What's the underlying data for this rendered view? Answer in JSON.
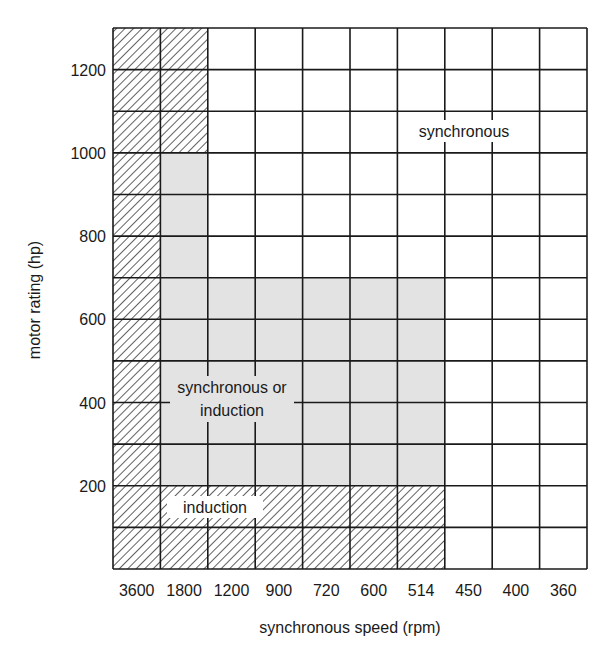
{
  "chart_data": {
    "type": "heatmap",
    "title": "",
    "xlabel": "synchronous speed (rpm)",
    "ylabel": "motor rating (hp)",
    "categories": [
      "3600",
      "1800",
      "1200",
      "900",
      "720",
      "600",
      "514",
      "450",
      "400",
      "360"
    ],
    "y_ticks": [
      200,
      400,
      600,
      800,
      1000,
      1200
    ],
    "ylim": [
      0,
      1300
    ],
    "row_step_hp": 100,
    "grid": true,
    "legend": null,
    "regions": [
      {
        "name": "induction",
        "pattern": "hatched",
        "cells": [
          {
            "cols": [
              "3600"
            ],
            "hp_range": [
              0,
              1300
            ]
          },
          {
            "cols": [
              "1800"
            ],
            "hp_range": [
              1000,
              1300
            ]
          },
          {
            "cols": [
              "1800",
              "1200",
              "900",
              "720",
              "600",
              "514"
            ],
            "hp_range": [
              0,
              200
            ]
          }
        ]
      },
      {
        "name": "synchronous or induction",
        "pattern": "grey",
        "cells": [
          {
            "cols": [
              "1800"
            ],
            "hp_range": [
              200,
              1000
            ]
          },
          {
            "cols": [
              "1200",
              "900",
              "720",
              "600",
              "514"
            ],
            "hp_range": [
              200,
              700
            ]
          }
        ]
      },
      {
        "name": "synchronous",
        "pattern": "white",
        "cells": [
          {
            "cols": [
              "1200",
              "900",
              "720",
              "600",
              "514"
            ],
            "hp_range": [
              700,
              1300
            ]
          },
          {
            "cols": [
              "450",
              "400",
              "360"
            ],
            "hp_range": [
              0,
              1300
            ]
          }
        ]
      }
    ],
    "annotations": [
      "synchronous",
      "synchronous or induction",
      "induction"
    ]
  },
  "labels": {
    "synchronous": "synchronous",
    "sync_or_ind_line1": "synchronous or",
    "sync_or_ind_line2": "induction",
    "induction": "induction",
    "xlabel": "synchronous speed (rpm)",
    "ylabel": "motor rating (hp)"
  },
  "colors": {
    "grid": "#1a1a1a",
    "grey_fill": "#e3e3e3",
    "hatch": "#3a3a3a",
    "background": "#ffffff"
  }
}
